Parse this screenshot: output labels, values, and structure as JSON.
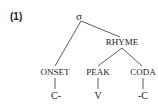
{
  "example_number": "(1)",
  "tree": {
    "root": "σ",
    "rhyme": "RHYME",
    "onset": "ONSET",
    "peak": "PEAK",
    "coda": "CODA",
    "onset_segment": "C-",
    "peak_segment": "V",
    "coda_segment": "-C"
  },
  "colors": {
    "ink": "#222222",
    "background": "#ffffff"
  }
}
